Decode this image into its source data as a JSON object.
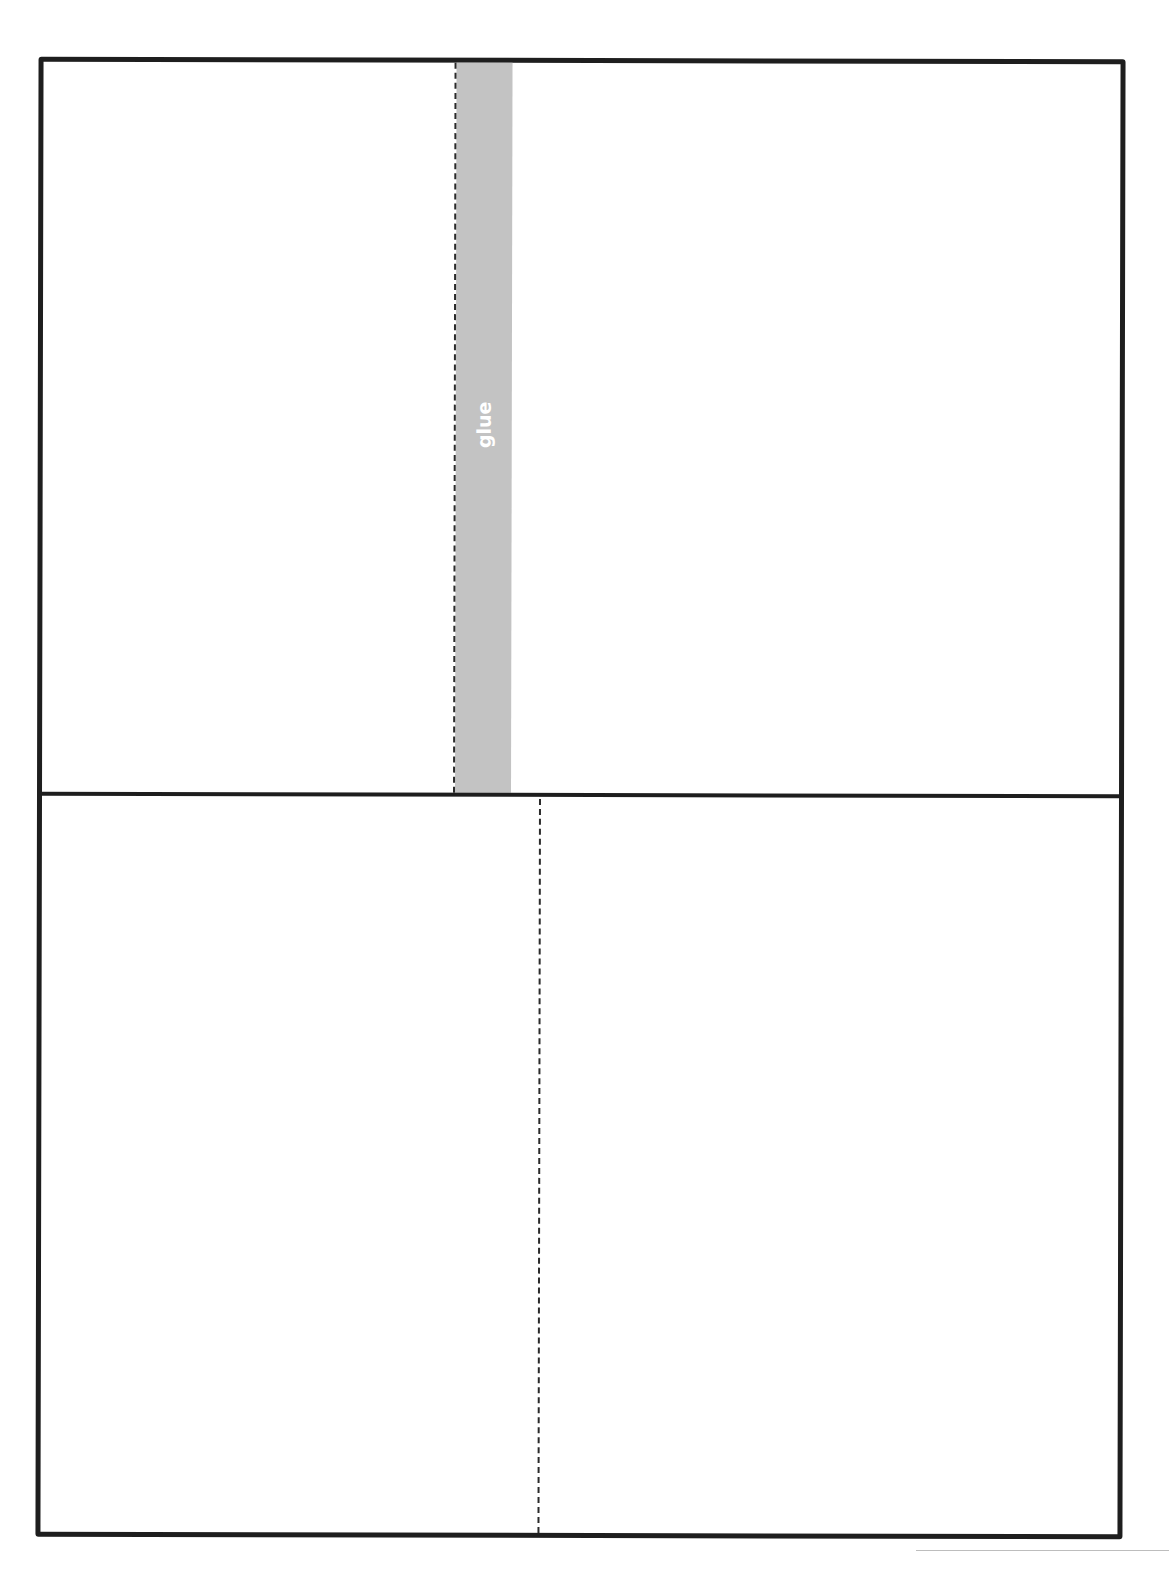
{
  "document": {
    "type": "foldable template",
    "glue_strip": {
      "label": "glue",
      "color": "#c3c3c3",
      "label_color": "#ffffff"
    },
    "border_color": "#1e1e1e",
    "fold_line_style": "dashed",
    "panels": [
      {
        "position": "top-left",
        "content": ""
      },
      {
        "position": "top-right",
        "content": ""
      },
      {
        "position": "bottom-left",
        "content": ""
      },
      {
        "position": "bottom-right",
        "content": ""
      }
    ]
  }
}
